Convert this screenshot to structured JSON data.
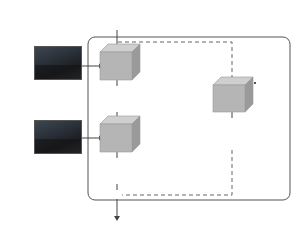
{
  "diagram": {
    "output_label_top": "O′",
    "output_label_bottom": "O′",
    "input_label": "D",
    "units": [
      {
        "name": "DN Unit",
        "ops": [
          "ReLU",
          "3×3-Conv"
        ]
      },
      {
        "name": "DN Unit",
        "ops": [
          "ReLU",
          "3×3-Conv"
        ]
      },
      {
        "name": "DN Unit",
        "ops": [
          "ReLU",
          "3×3-Conv"
        ]
      }
    ],
    "sum_symbol": "⊕",
    "colors": {
      "cube_front": "#b5b5b5",
      "cube_top": "#cfcfcf",
      "cube_side": "#9a9a9a",
      "frame": "#444444",
      "dashed": "#555555"
    }
  }
}
